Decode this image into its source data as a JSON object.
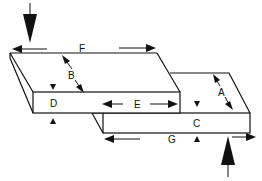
{
  "diagram": {
    "labels": {
      "A": "A",
      "B": "B",
      "C": "C",
      "D": "D",
      "E": "E",
      "F": "F",
      "G": "G"
    },
    "forces": [
      {
        "name": "top-force",
        "direction": "down"
      },
      {
        "name": "bottom-force",
        "direction": "up"
      }
    ],
    "colors": {
      "line": "#111111",
      "background": "#ffffff"
    }
  }
}
